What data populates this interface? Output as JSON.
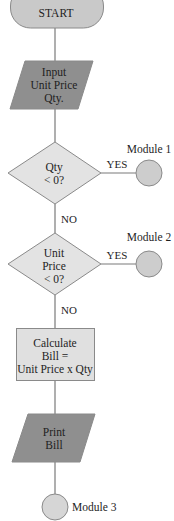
{
  "flowchart": {
    "colors": {
      "terminator_fill": "#c9c9c9",
      "io_fill": "#8f8f8f",
      "decision_fill": "#e3e3e3",
      "process_fill": "#e0e0e0",
      "connector_fill": "#cdcdcd",
      "edge": "#7a7a7a",
      "text": "#1e1e1e"
    },
    "nodes": {
      "start": {
        "type": "terminator",
        "label": "START"
      },
      "input": {
        "type": "input-output",
        "lines": [
          "Input",
          "Unit Price",
          "Qty."
        ]
      },
      "decision_qty": {
        "type": "decision",
        "lines": [
          "Qty",
          "< 0?"
        ]
      },
      "decision_price": {
        "type": "decision",
        "lines": [
          "Unit",
          "Price",
          "< 0?"
        ]
      },
      "calculate": {
        "type": "process",
        "lines": [
          "Calculate",
          "Bill =",
          "Unit Price x Qty"
        ]
      },
      "print": {
        "type": "input-output",
        "lines": [
          "Print",
          "Bill"
        ]
      },
      "module1": {
        "type": "connector",
        "label": "Module 1"
      },
      "module2": {
        "type": "connector",
        "label": "Module 2"
      },
      "module3": {
        "type": "connector",
        "label": "Module 3"
      }
    },
    "edges": {
      "qty_yes": "YES",
      "qty_no": "NO",
      "price_yes": "YES",
      "price_no": "NO"
    }
  }
}
